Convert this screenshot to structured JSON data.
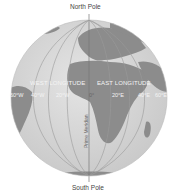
{
  "diagram": {
    "labels": {
      "north_pole": "North Pole",
      "south_pole": "South Pole",
      "west_longitude": "WEST LONGITUDE",
      "east_longitude": "EAST LONGITUDE",
      "prime_meridian": "Prime Meridian"
    },
    "ticks": [
      "60°W",
      "40°W",
      "20°W",
      "0°",
      "20°E",
      "40°E",
      "60°E"
    ],
    "colors": {
      "background": "#ffffff",
      "ocean": "#d9d9d9",
      "land": "#8a8a8a",
      "meridian_lines": "#9a9a9a",
      "prime_meridian": "#777777",
      "label_text": "#444444"
    }
  }
}
